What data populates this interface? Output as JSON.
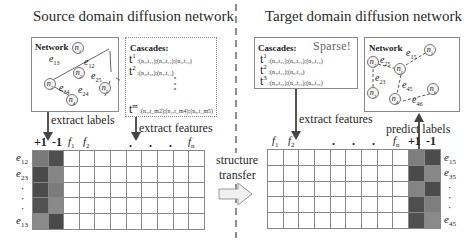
{
  "source": {
    "title": "Source domain diffusion network",
    "network": {
      "label": "Network",
      "nodes": [
        "n1",
        "n2",
        "n3",
        "n4",
        "n5"
      ],
      "edges": [
        {
          "id": "e13",
          "sub": "13"
        },
        {
          "id": "e12",
          "sub": "12"
        },
        {
          "id": "e25",
          "sub": "25"
        },
        {
          "id": "e34",
          "sub": "34"
        },
        {
          "id": "e24",
          "sub": "24"
        }
      ],
      "edge_style": "solid"
    },
    "cascades": {
      "label": "Cascades:",
      "lines": [
        {
          "t": "t",
          "sup": "1",
          "text": ":(n₁,t₁₁);(n₂,t₁₂);(n₃,t₁₃)"
        },
        {
          "t": "t",
          "sup": "2",
          "text": ":(n₃,t₂₃);(n₄,t₂₄)"
        },
        {
          "t": "t",
          "sup": "m",
          "text": ":(n₂,t_m2);(n₄,t_m4);(n₅,t_m5)"
        }
      ],
      "ellipsis": "⋮"
    },
    "arrows": {
      "extract_labels": "extract labels",
      "extract_features": "extract features"
    },
    "matrix": {
      "label_cols": [
        "+1",
        "-1"
      ],
      "feature_cols": [
        {
          "f": "f",
          "sub": "1"
        },
        {
          "f": "f",
          "sub": "2"
        },
        {
          "f": "f",
          "sub": "n"
        }
      ],
      "feature_ellipsis": ". . .",
      "rows": [
        {
          "e": "e",
          "sub": "12"
        },
        {
          "e": "e",
          "sub": "23"
        },
        {
          "e": "·",
          "sub": ""
        },
        {
          "e": "·",
          "sub": ""
        },
        {
          "e": "·",
          "sub": ""
        },
        {
          "e": "e",
          "sub": "13"
        }
      ],
      "row_count": 5,
      "feature_col_count": 9,
      "label_shades": [
        [
          "#7a7a7a",
          "#4e4e4e"
        ],
        [
          "#4a4a4a",
          "#868686"
        ],
        [
          "#4c4c4c",
          "#7c7c7c"
        ],
        [
          "#525252",
          "#8a8a8a"
        ],
        [
          "#8a8a8a",
          "#4a4a4a"
        ]
      ]
    }
  },
  "transfer": {
    "line1": "structure",
    "line2": "transfer"
  },
  "target": {
    "title": "Target domain diffusion network",
    "network": {
      "label": "Network",
      "nodes": [
        "n1",
        "n2",
        "n3",
        "n4",
        "n5",
        "n6"
      ],
      "edges": [
        {
          "id": "e25",
          "sub": "25"
        },
        {
          "id": "e15",
          "sub": "15"
        },
        {
          "id": "e23",
          "sub": "23"
        },
        {
          "id": "e45",
          "sub": "45"
        },
        {
          "id": "e46",
          "sub": "46"
        }
      ],
      "edge_style": "dashed"
    },
    "cascades": {
      "label": "Cascades:",
      "sparse": "Sparse!",
      "lines": [
        {
          "t": "t",
          "sup": "1",
          "text": ":(n₁,t₁₁);(n₅,t₁₅);(n₄,t₁₄)"
        },
        {
          "t": "t",
          "sup": "2",
          "text": ":(n₄,t₂₄);(n₆,t₂₆)"
        },
        {
          "t": "t",
          "sup": "3",
          "text": ":(n₃,t₃₃);(n₂,t₃₂);(n₅,t₃₅)"
        }
      ]
    },
    "arrows": {
      "extract_features": "extract features",
      "predict_labels": "predict labels"
    },
    "matrix": {
      "label_cols": [
        "+1",
        "-1"
      ],
      "feature_cols": [
        {
          "f": "f",
          "sub": "1"
        },
        {
          "f": "f",
          "sub": "2"
        },
        {
          "f": "f",
          "sub": "n"
        }
      ],
      "feature_ellipsis": ". . .",
      "rows": [
        {
          "e": "e",
          "sub": "15"
        },
        {
          "e": "e",
          "sub": "35"
        },
        {
          "e": "·",
          "sub": ""
        },
        {
          "e": "·",
          "sub": ""
        },
        {
          "e": "·",
          "sub": ""
        },
        {
          "e": "e",
          "sub": "45"
        }
      ],
      "row_count": 5,
      "feature_col_count": 9,
      "label_shades": [
        [
          "#7e7e7e",
          "#4c4c4c"
        ],
        [
          "#4a4a4a",
          "#888888"
        ],
        [
          "#848484",
          "#4c4c4c"
        ],
        [
          "#4e4e4e",
          "#7e7e7e"
        ],
        [
          "#505050",
          "#8a8a8a"
        ]
      ]
    }
  },
  "colors": {
    "border": "#888888",
    "dark_cell": "#4c4c4c",
    "mid_cell": "#808080",
    "arrow": "#444444",
    "divider": "#555555"
  }
}
